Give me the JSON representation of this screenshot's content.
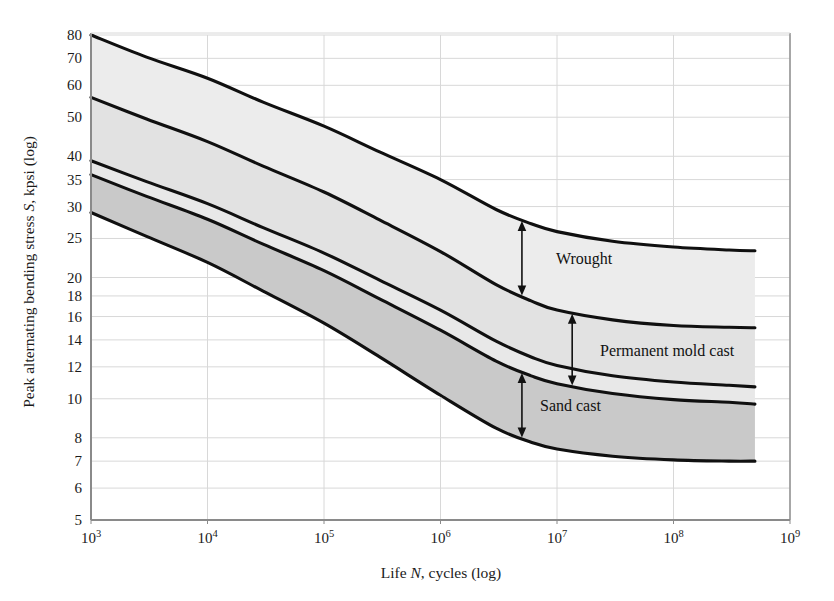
{
  "figure": {
    "background": "#ffffff",
    "plot_border_color": "#8a8a8a",
    "grid_color": "#d8d8d8",
    "curve_color": "#101010"
  },
  "axes": {
    "x_title_parts": {
      "pre": "Life ",
      "italic": "N",
      "post": ", cycles (log)"
    },
    "x_title_full": "Life N, cycles (log)",
    "y_title_parts": {
      "pre": "Peak alternating bending stress ",
      "italic": "S",
      "post": ", kpsi (log)"
    },
    "y_title_full": "Peak alternating bending stress S, kpsi (log)",
    "x_tick_mantissa": "10",
    "x_tick_exponents": [
      "3",
      "4",
      "5",
      "6",
      "7",
      "8",
      "9"
    ],
    "y_tick_labels": [
      "5",
      "6",
      "7",
      "8",
      "10",
      "12",
      "14",
      "16",
      "18",
      "20",
      "25",
      "30",
      "35",
      "40",
      "50",
      "60",
      "70",
      "80"
    ]
  },
  "annotations": [
    {
      "id": "wrought",
      "label": "Wrought"
    },
    {
      "id": "permanent-mold-cast",
      "label": "Permanent mold cast"
    },
    {
      "id": "sand-cast",
      "label": "Sand cast"
    }
  ],
  "chart_data": {
    "type": "area",
    "title": "",
    "subtitle": "",
    "xlabel": "Life N, cycles (log)",
    "ylabel": "Peak alternating bending stress S, kpsi (log)",
    "xscale": "log",
    "yscale": "log",
    "xlim": [
      1000,
      1000000000
    ],
    "ylim": [
      5,
      80
    ],
    "x_ticks": [
      1000,
      10000,
      100000,
      1000000,
      10000000,
      100000000,
      1000000000
    ],
    "y_ticks": [
      5,
      6,
      7,
      8,
      10,
      12,
      14,
      16,
      18,
      20,
      25,
      30,
      35,
      40,
      50,
      60,
      70,
      80
    ],
    "grid": true,
    "legend": "none",
    "x_data": [
      1000,
      3000,
      10000,
      30000,
      100000,
      300000,
      1000000,
      3000000,
      6000000,
      10000000,
      30000000,
      100000000,
      300000000,
      500000000
    ],
    "series": [
      {
        "name": "Wrought upper",
        "values": [
          80,
          70.5,
          62.5,
          54.5,
          47.5,
          41.0,
          35.0,
          29.5,
          27.2,
          26.0,
          24.6,
          23.8,
          23.4,
          23.3
        ]
      },
      {
        "name": "Wrought lower",
        "values": [
          56.0,
          49.5,
          43.5,
          37.8,
          32.6,
          27.8,
          23.2,
          19.2,
          17.5,
          16.6,
          15.7,
          15.2,
          15.05,
          15.0
        ]
      },
      {
        "name": "Permanent mold cast upper",
        "values": [
          39.0,
          34.6,
          30.5,
          26.6,
          23.0,
          19.7,
          16.6,
          13.9,
          12.7,
          12.1,
          11.4,
          11.0,
          10.8,
          10.7
        ]
      },
      {
        "name": "Permanent mold cast lower",
        "values": [
          36.0,
          31.8,
          27.9,
          24.2,
          20.8,
          17.7,
          14.8,
          12.4,
          11.4,
          10.9,
          10.3,
          9.95,
          9.8,
          9.7
        ]
      },
      {
        "name": "Sand cast lower",
        "values": [
          29.0,
          25.3,
          21.8,
          18.5,
          15.4,
          12.7,
          10.2,
          8.45,
          7.8,
          7.5,
          7.2,
          7.05,
          7.0,
          7.0
        ]
      }
    ],
    "bands": [
      {
        "name": "Wrought",
        "upper": "Wrought upper",
        "lower": "Wrought lower",
        "fill": "#ececec"
      },
      {
        "name": "Permanent mold cast",
        "upper": "Wrought lower",
        "lower": "Permanent mold cast upper",
        "fill": "#e2e2e2"
      },
      {
        "name": "Gap",
        "upper": "Permanent mold cast upper",
        "lower": "Permanent mold cast lower",
        "fill": "#e8e8e8"
      },
      {
        "name": "Sand cast",
        "upper": "Permanent mold cast lower",
        "lower": "Sand cast lower",
        "fill": "#c9c9c9"
      }
    ]
  }
}
